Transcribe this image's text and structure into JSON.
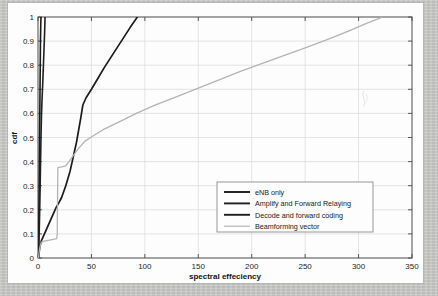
{
  "chart_data": {
    "type": "line",
    "title": "",
    "xlabel": "spectral effeciency",
    "ylabel": "cdf",
    "xlim": [
      0,
      350
    ],
    "ylim": [
      0,
      1
    ],
    "xticks": [
      0,
      50,
      100,
      150,
      200,
      250,
      300,
      350
    ],
    "xtick_labels": [
      "0",
      "50",
      "100",
      "150",
      "200",
      "250",
      "300",
      "350"
    ],
    "yticks": [
      0,
      0.1,
      0.2,
      0.3,
      0.4,
      0.5,
      0.6,
      0.7,
      0.8,
      0.9,
      1
    ],
    "ytick_labels": [
      "0",
      "0.1",
      "0.2",
      "0.3",
      "0.4",
      "0.5",
      "0.6",
      "0.7",
      "0.8",
      "0.9",
      "1"
    ],
    "grid": true,
    "legend_position": "center-right",
    "series": [
      {
        "name": "eNB only",
        "color": "#1a1a1a",
        "width": 1.6,
        "points": [
          [
            0.3,
            0.0
          ],
          [
            0.5,
            0.05
          ],
          [
            0.7,
            0.12
          ],
          [
            0.9,
            0.2
          ],
          [
            1.1,
            0.3
          ],
          [
            1.3,
            0.4
          ],
          [
            1.5,
            0.5
          ],
          [
            1.7,
            0.6
          ],
          [
            1.9,
            0.7
          ],
          [
            2.1,
            0.8
          ],
          [
            2.3,
            0.9
          ],
          [
            2.6,
            0.97
          ],
          [
            2.8,
            1.0
          ]
        ]
      },
      {
        "name": "Amplify and Forward Relaying",
        "color": "#202020",
        "width": 1.6,
        "points": [
          [
            0.4,
            0.0
          ],
          [
            0.8,
            0.05
          ],
          [
            1.2,
            0.12
          ],
          [
            1.6,
            0.2
          ],
          [
            2.0,
            0.3
          ],
          [
            2.4,
            0.4
          ],
          [
            2.8,
            0.5
          ],
          [
            3.3,
            0.6
          ],
          [
            3.8,
            0.66
          ],
          [
            4.4,
            0.72
          ],
          [
            4.9,
            0.78
          ],
          [
            5.4,
            0.84
          ],
          [
            5.9,
            0.9
          ],
          [
            6.3,
            0.95
          ],
          [
            6.6,
            1.0
          ]
        ]
      },
      {
        "name": "Decode and forward coding",
        "color": "#1c1c1c",
        "width": 1.7,
        "points": [
          [
            0.5,
            0.0
          ],
          [
            1.5,
            0.04
          ],
          [
            3.0,
            0.07
          ],
          [
            5.0,
            0.09
          ],
          [
            8.0,
            0.12
          ],
          [
            11.0,
            0.15
          ],
          [
            14.0,
            0.18
          ],
          [
            17.0,
            0.21
          ],
          [
            19.0,
            0.225
          ],
          [
            22.0,
            0.25
          ],
          [
            24.0,
            0.275
          ],
          [
            26.0,
            0.3
          ],
          [
            28.0,
            0.33
          ],
          [
            30.0,
            0.36
          ],
          [
            32.0,
            0.4
          ],
          [
            34.0,
            0.44
          ],
          [
            36.0,
            0.48
          ],
          [
            38.0,
            0.53
          ],
          [
            40.0,
            0.58
          ],
          [
            42.0,
            0.635
          ],
          [
            45.0,
            0.665
          ],
          [
            50.0,
            0.7
          ],
          [
            56.0,
            0.745
          ],
          [
            62.0,
            0.79
          ],
          [
            70.0,
            0.845
          ],
          [
            78.0,
            0.9
          ],
          [
            86.0,
            0.955
          ],
          [
            93.0,
            1.0
          ]
        ]
      },
      {
        "name": "Beamforming vector",
        "color": "#b4b4b4",
        "width": 1.3,
        "points": [
          [
            0.4,
            0.0
          ],
          [
            1.5,
            0.04
          ],
          [
            3.0,
            0.065
          ],
          [
            6.0,
            0.07
          ],
          [
            12.0,
            0.075
          ],
          [
            17.5,
            0.08
          ],
          [
            18.0,
            0.1
          ],
          [
            18.2,
            0.2
          ],
          [
            18.4,
            0.3
          ],
          [
            18.6,
            0.375
          ],
          [
            22.0,
            0.378
          ],
          [
            26.0,
            0.382
          ],
          [
            29.0,
            0.4
          ],
          [
            33.0,
            0.425
          ],
          [
            38.0,
            0.455
          ],
          [
            44.0,
            0.485
          ],
          [
            51.0,
            0.505
          ],
          [
            62.0,
            0.535
          ],
          [
            76.0,
            0.565
          ],
          [
            92.0,
            0.6
          ],
          [
            110.0,
            0.635
          ],
          [
            130.0,
            0.67
          ],
          [
            150.0,
            0.705
          ],
          [
            170.0,
            0.74
          ],
          [
            190.0,
            0.775
          ],
          [
            210.0,
            0.808
          ],
          [
            230.0,
            0.84
          ],
          [
            250.0,
            0.872
          ],
          [
            270.0,
            0.905
          ],
          [
            290.0,
            0.94
          ],
          [
            308.0,
            0.975
          ],
          [
            320.0,
            0.995
          ],
          [
            322.0,
            1.0
          ]
        ]
      }
    ]
  },
  "legend": {
    "items": [
      {
        "label": "eNB only",
        "color": "#1a1a1a"
      },
      {
        "label": "Amplify and Forward Relaying",
        "color": "#202020"
      },
      {
        "label": "Decode and forward coding",
        "color": "#1c1c1c"
      },
      {
        "label": "Beamforming vector",
        "color": "#b4b4b4"
      }
    ]
  },
  "figure": {
    "background": "#fdfdfd",
    "page_background": "#c9c9c7",
    "grid_color": "#d8d8d8",
    "axis_color": "#4a4a4a"
  }
}
